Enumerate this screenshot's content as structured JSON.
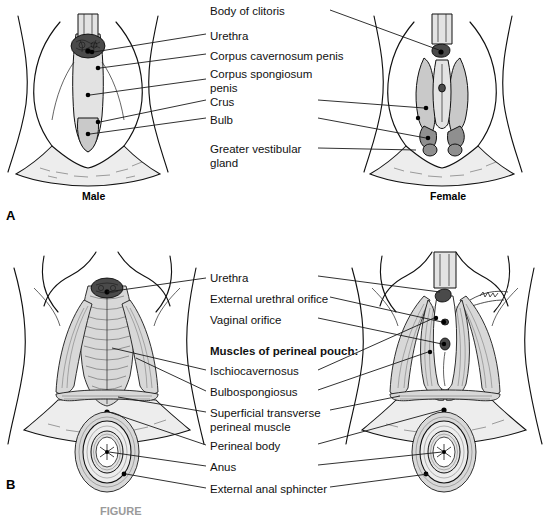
{
  "figure": {
    "panels": [
      {
        "letter": "A",
        "x": 6,
        "y": 208
      },
      {
        "letter": "B",
        "x": 6,
        "y": 477
      }
    ],
    "sex_labels": [
      {
        "text": "Male",
        "x": 82,
        "y": 190
      },
      {
        "text": "Female",
        "x": 430,
        "y": 190
      }
    ],
    "caption": "FIGURE"
  },
  "panel_a": {
    "labels": [
      {
        "id": "body-of-clitoris",
        "text": "Body of clitoris",
        "x": 210,
        "y": 5,
        "bold": false
      },
      {
        "id": "urethra",
        "text": "Urethra",
        "x": 210,
        "y": 30,
        "bold": false
      },
      {
        "id": "corpus-cavernosum-penis",
        "text": "Corpus cavernosum penis",
        "x": 210,
        "y": 50,
        "bold": false
      },
      {
        "id": "corpus-spongiosum-penis",
        "text": "Corpus spongiosum\npenis",
        "x": 210,
        "y": 68,
        "bold": false
      },
      {
        "id": "crus",
        "text": "Crus",
        "x": 210,
        "y": 96,
        "bold": false
      },
      {
        "id": "bulb",
        "text": "Bulb",
        "x": 210,
        "y": 114,
        "bold": false
      },
      {
        "id": "greater-vestibular-gland",
        "text": "Greater vestibular\ngland",
        "x": 210,
        "y": 143,
        "bold": false
      }
    ]
  },
  "panel_b": {
    "labels": [
      {
        "id": "urethra",
        "text": "Urethra",
        "x": 210,
        "y": 272,
        "bold": false
      },
      {
        "id": "external-urethral-orifice",
        "text": "External urethral orifice",
        "x": 210,
        "y": 293,
        "bold": false
      },
      {
        "id": "vaginal-orifice",
        "text": "Vaginal orifice",
        "x": 210,
        "y": 314,
        "bold": false
      },
      {
        "id": "muscles-of-perineal-pouch",
        "text": "Muscles of perineal pouch:",
        "x": 210,
        "y": 345,
        "bold": true
      },
      {
        "id": "ischiocavernosus",
        "text": "Ischiocavernosus",
        "x": 210,
        "y": 365,
        "bold": false
      },
      {
        "id": "bulbospongiosus",
        "text": "Bulbospongiosus",
        "x": 210,
        "y": 386,
        "bold": false
      },
      {
        "id": "superficial-transverse-perineal-muscle",
        "text": "Superficial transverse\nperineal muscle",
        "x": 210,
        "y": 407,
        "bold": false
      },
      {
        "id": "perineal-body",
        "text": "Perineal body",
        "x": 210,
        "y": 440,
        "bold": false
      },
      {
        "id": "anus",
        "text": "Anus",
        "x": 210,
        "y": 461,
        "bold": false
      },
      {
        "id": "external-anal-sphincter",
        "text": "External anal sphincter",
        "x": 210,
        "y": 483,
        "bold": false
      }
    ]
  },
  "colors": {
    "background": "#ffffff",
    "ink": "#111111",
    "leader_line": "#1a1a1a",
    "muscle_fill": "#d8d8d8",
    "fascia_fill": "#ededed",
    "dark_tissue": "#4a4a4a"
  }
}
